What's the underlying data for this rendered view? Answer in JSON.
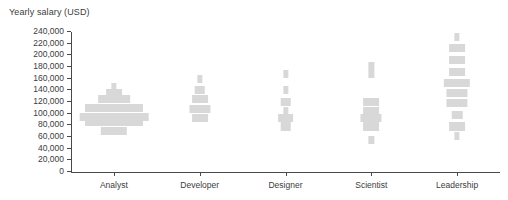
{
  "chart_data": {
    "type": "bar",
    "title": "Yearly salary (USD)",
    "xlabel": "",
    "ylabel": "Yearly salary (USD)",
    "ylim": [
      0,
      240000
    ],
    "ytick_step": 20000,
    "yticks": [
      "240,000",
      "220,000",
      "200,000",
      "180,000",
      "160,000",
      "140,000",
      "120,000",
      "100,000",
      "80,000",
      "60,000",
      "40,000",
      "20,000",
      "0"
    ],
    "ytick_values": [
      240000,
      220000,
      200000,
      180000,
      160000,
      140000,
      120000,
      100000,
      80000,
      60000,
      40000,
      20000,
      0
    ],
    "grid": false,
    "legend": null,
    "orientation": "vertical-histogram",
    "bar_color": "#d8d8d8",
    "axis_color": "#4a4a4a",
    "text_color": "#3c3c3c",
    "categories": [
      "Analyst",
      "Developer",
      "Designer",
      "Scientist",
      "Leadership"
    ],
    "series": [
      {
        "name": "Analyst",
        "bins": [
          {
            "salary": 145000,
            "count": 1
          },
          {
            "salary": 135000,
            "count": 3
          },
          {
            "salary": 125000,
            "count": 6
          },
          {
            "salary": 110000,
            "count": 11
          },
          {
            "salary": 95000,
            "count": 13
          },
          {
            "salary": 85000,
            "count": 11
          },
          {
            "salary": 70000,
            "count": 5
          }
        ]
      },
      {
        "name": "Developer",
        "bins": [
          {
            "salary": 160000,
            "count": 1
          },
          {
            "salary": 140000,
            "count": 2
          },
          {
            "salary": 125000,
            "count": 3
          },
          {
            "salary": 108000,
            "count": 4
          },
          {
            "salary": 92000,
            "count": 3
          }
        ]
      },
      {
        "name": "Designer",
        "bins": [
          {
            "salary": 168000,
            "count": 1
          },
          {
            "salary": 140000,
            "count": 1
          },
          {
            "salary": 120000,
            "count": 2
          },
          {
            "salary": 105000,
            "count": 1
          },
          {
            "salary": 92000,
            "count": 3
          },
          {
            "salary": 78000,
            "count": 2
          }
        ]
      },
      {
        "name": "Scientist",
        "bins": [
          {
            "salary": 182000,
            "count": 1
          },
          {
            "salary": 168000,
            "count": 1
          },
          {
            "salary": 120000,
            "count": 3
          },
          {
            "salary": 105000,
            "count": 3
          },
          {
            "salary": 92000,
            "count": 4
          },
          {
            "salary": 78000,
            "count": 3
          },
          {
            "salary": 55000,
            "count": 1
          }
        ]
      },
      {
        "name": "Leadership",
        "bins": [
          {
            "salary": 232000,
            "count": 1
          },
          {
            "salary": 212000,
            "count": 3
          },
          {
            "salary": 192000,
            "count": 3
          },
          {
            "salary": 172000,
            "count": 3
          },
          {
            "salary": 152000,
            "count": 5
          },
          {
            "salary": 135000,
            "count": 4
          },
          {
            "salary": 118000,
            "count": 4
          },
          {
            "salary": 98000,
            "count": 2
          },
          {
            "salary": 78000,
            "count": 3
          },
          {
            "salary": 62000,
            "count": 1
          }
        ]
      }
    ]
  }
}
